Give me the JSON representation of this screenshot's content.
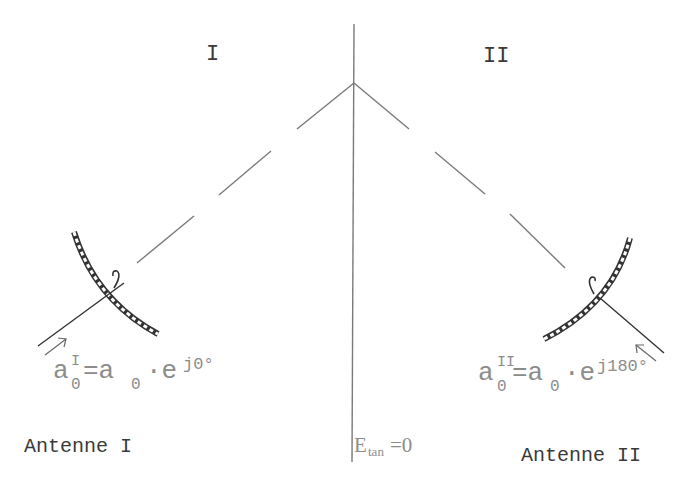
{
  "diagram": {
    "region_labels": {
      "left": "I",
      "right": "II"
    },
    "antenna_labels": {
      "left": "Antenne I",
      "right": "Antenne II"
    },
    "formula_left": {
      "base": "a",
      "sub": "0",
      "sup": "I",
      "eq": "=a",
      "sub2": "0",
      "dot": "·e",
      "exp": "j0°"
    },
    "formula_right": {
      "base": "a",
      "sub": "0",
      "sup": "II",
      "eq": "=a",
      "sub2": "0",
      "dot": "·e",
      "exp": "j180°"
    },
    "boundary_condition": {
      "symbol": "E",
      "sub": "tan",
      "value": "=0"
    },
    "colors": {
      "line": "#7a7a7a",
      "antenna": "#333333",
      "formula_text": "#8c8c8c",
      "label_text": "#3a3a3a"
    }
  }
}
